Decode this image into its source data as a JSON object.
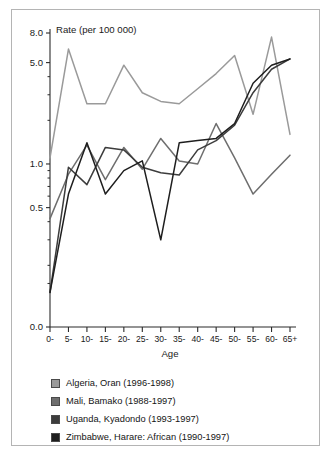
{
  "chart_data": {
    "type": "line",
    "title": "",
    "ylabel": "Rate (per 100 000)",
    "xlabel": "Age",
    "yscale": "log",
    "ylim": [
      0.1,
      8.0
    ],
    "grid": false,
    "legend_position": "bottom",
    "categories": [
      "0-",
      "5-",
      "10-",
      "15-",
      "20-",
      "25-",
      "30-",
      "35-",
      "40-",
      "45-",
      "50-",
      "55-",
      "60-",
      "65+"
    ],
    "ytick_labels": [
      "8.0",
      "5.0",
      "1.0",
      "0.5",
      "0.0"
    ],
    "ytick_values": [
      8.0,
      5.0,
      1.0,
      0.5,
      0.0
    ],
    "yminor_values": [
      4.0,
      3.0,
      2.0,
      0.9,
      0.8,
      0.7,
      0.6,
      0.4,
      0.3,
      0.2
    ],
    "series": [
      {
        "name": "Algeria, Oran (1996-1998)",
        "color": "#9a9a9a",
        "values": [
          1.1,
          6.2,
          2.6,
          2.6,
          4.8,
          3.1,
          2.7,
          2.6,
          3.3,
          4.2,
          5.6,
          2.2,
          7.5,
          1.6
        ]
      },
      {
        "name": "Mali, Bamako (1988-1997)",
        "color": "#6e6e6e",
        "values": [
          0.42,
          0.85,
          1.35,
          0.78,
          1.3,
          0.92,
          1.5,
          1.05,
          1.0,
          1.9,
          1.1,
          0.62,
          0.85,
          1.15
        ]
      },
      {
        "name": "Uganda, Kyadondo (1993-1997)",
        "color": "#3c3c3c",
        "values": [
          0.13,
          0.95,
          0.72,
          1.3,
          1.25,
          0.95,
          0.87,
          0.84,
          1.25,
          1.45,
          1.85,
          3.1,
          4.5,
          5.3
        ]
      },
      {
        "name": "Zimbabwe, Harare: African (1990-1997)",
        "color": "#1e1e1e",
        "values": [
          0.13,
          0.62,
          1.4,
          0.62,
          0.9,
          1.05,
          0.3,
          1.4,
          1.45,
          1.5,
          1.9,
          3.6,
          4.8,
          5.3
        ]
      }
    ]
  },
  "legend": {
    "items": [
      {
        "label": "Algeria, Oran (1996-1998)",
        "color": "#9a9a9a"
      },
      {
        "label": "Mali, Bamako (1988-1997)",
        "color": "#6e6e6e"
      },
      {
        "label": "Uganda, Kyadondo (1993-1997)",
        "color": "#3c3c3c"
      },
      {
        "label": "Zimbabwe, Harare: African (1990-1997)",
        "color": "#1e1e1e"
      }
    ]
  }
}
